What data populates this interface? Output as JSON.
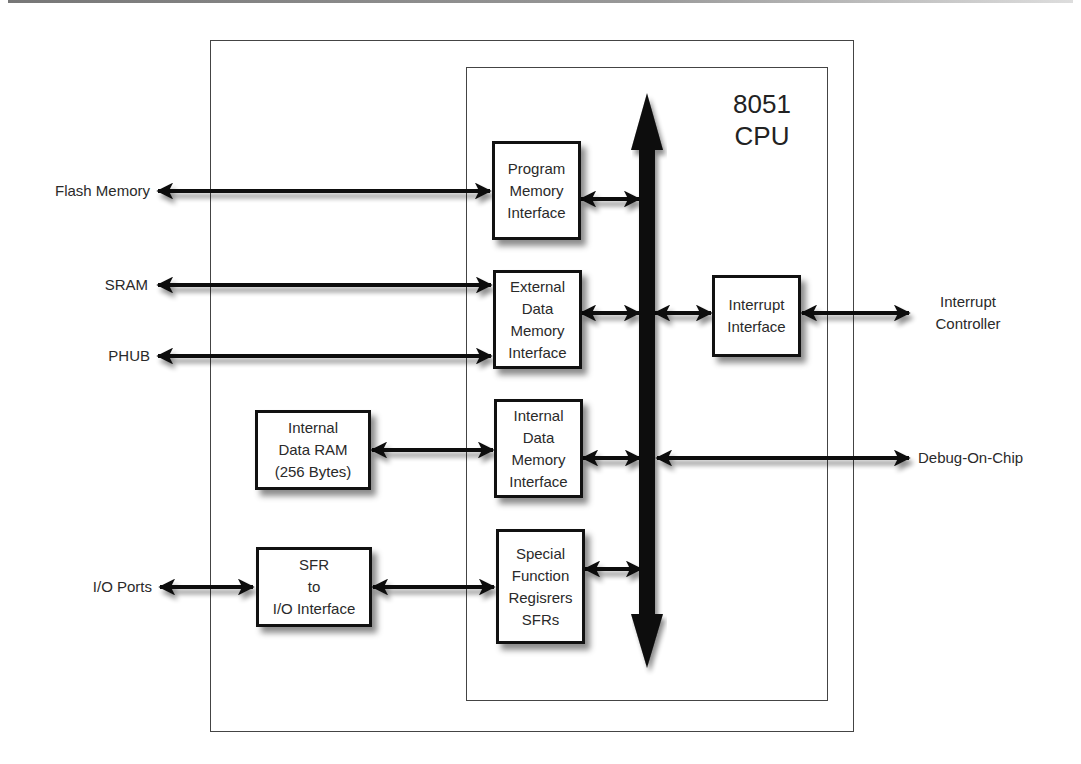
{
  "diagram": {
    "title": "8051\nCPU",
    "external_labels": {
      "flash_memory": "Flash Memory",
      "sram": "SRAM",
      "phub": "PHUB",
      "io_ports": "I/O Ports",
      "interrupt_controller": "Interrupt\nController",
      "debug_on_chip": "Debug-On-Chip"
    },
    "blocks": {
      "program_memory_interface": "Program\nMemory\nInterface",
      "external_data_memory_interface": "External\nData\nMemory\nInterface",
      "internal_data_memory_interface": "Internal\nData\nMemory\nInterface",
      "special_function_registers": "Special\nFunction\nRegisrers\nSFRs",
      "interrupt_interface": "Interrupt\nInterface",
      "internal_data_ram": "Internal\nData RAM\n(256 Bytes)",
      "sfr_to_io_interface": "SFR\nto\nI/O Interface"
    },
    "connections": [
      {
        "from": "Flash Memory",
        "to": "Program Memory Interface",
        "type": "bidirectional"
      },
      {
        "from": "SRAM",
        "to": "External Data Memory Interface",
        "type": "bidirectional"
      },
      {
        "from": "PHUB",
        "to": "External Data Memory Interface",
        "type": "bidirectional"
      },
      {
        "from": "Internal Data RAM (256 Bytes)",
        "to": "Internal Data Memory Interface",
        "type": "bidirectional"
      },
      {
        "from": "I/O Ports",
        "to": "SFR to I/O Interface",
        "type": "bidirectional"
      },
      {
        "from": "SFR to I/O Interface",
        "to": "Special Function Registers SFRs",
        "type": "bidirectional"
      },
      {
        "from": "Program Memory Interface",
        "to": "CPU Bus",
        "type": "bidirectional"
      },
      {
        "from": "External Data Memory Interface",
        "to": "CPU Bus",
        "type": "bidirectional"
      },
      {
        "from": "Internal Data Memory Interface",
        "to": "CPU Bus",
        "type": "bidirectional"
      },
      {
        "from": "Special Function Registers SFRs",
        "to": "CPU Bus",
        "type": "bidirectional"
      },
      {
        "from": "CPU Bus",
        "to": "Interrupt Interface",
        "type": "bidirectional"
      },
      {
        "from": "Interrupt Interface",
        "to": "Interrupt Controller",
        "type": "bidirectional"
      },
      {
        "from": "CPU Bus",
        "to": "Debug-On-Chip",
        "type": "bidirectional"
      }
    ]
  }
}
